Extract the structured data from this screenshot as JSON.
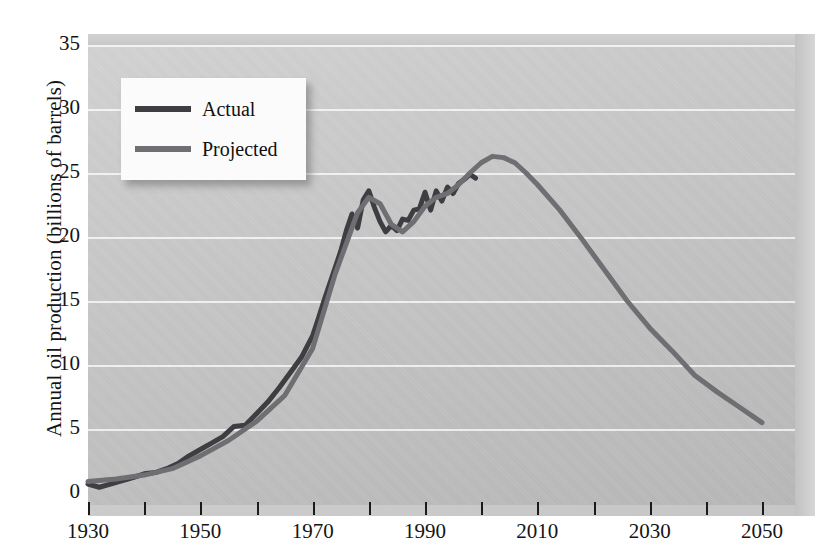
{
  "chart_data": {
    "type": "line",
    "title": "",
    "xlabel": "",
    "ylabel": "Annual oil production (billions of barrels)",
    "xlim": [
      1930,
      2050
    ],
    "ylim": [
      0,
      35
    ],
    "grid": true,
    "legend_position": "upper-left",
    "y_ticks": [
      0,
      5,
      10,
      15,
      20,
      25,
      30,
      35
    ],
    "y_tick_labels": [
      "0",
      "5",
      "10",
      "15",
      "20",
      "25",
      "30",
      "35"
    ],
    "x_ticks": [
      1930,
      1940,
      1950,
      1960,
      1970,
      1980,
      1990,
      2000,
      2010,
      2020,
      2030,
      2040,
      2050
    ],
    "x_tick_labels": [
      "1930",
      "",
      "1950",
      "",
      "1970",
      "",
      "1990",
      "",
      "2010",
      "",
      "2030",
      "",
      "2050"
    ],
    "x_labeled_ticks": [
      "1930",
      "1950",
      "1970",
      "1990",
      "2010",
      "2030",
      "2050"
    ],
    "series": [
      {
        "name": "Actual",
        "color": "#3e3e42",
        "x": [
          1930,
          1932,
          1934,
          1936,
          1938,
          1940,
          1942,
          1944,
          1946,
          1948,
          1950,
          1952,
          1954,
          1956,
          1958,
          1960,
          1962,
          1964,
          1966,
          1968,
          1970,
          1971,
          1972,
          1973,
          1974,
          1975,
          1976,
          1977,
          1978,
          1979,
          1980,
          1981,
          1982,
          1983,
          1984,
          1985,
          1986,
          1987,
          1988,
          1989,
          1990,
          1991,
          1992,
          1993,
          1994,
          1995,
          1996,
          1997,
          1998,
          1999
        ],
        "y": [
          0.7,
          0.45,
          0.7,
          0.95,
          1.2,
          1.5,
          1.6,
          1.9,
          2.3,
          2.9,
          3.4,
          3.9,
          4.4,
          5.2,
          5.3,
          6.2,
          7.1,
          8.2,
          9.4,
          10.6,
          12.3,
          13.6,
          15.0,
          16.3,
          17.6,
          18.9,
          20.5,
          21.8,
          20.7,
          22.9,
          23.6,
          22.3,
          21.2,
          20.4,
          20.9,
          20.5,
          21.4,
          21.3,
          22.1,
          22.2,
          23.5,
          22.1,
          23.6,
          22.8,
          23.9,
          23.4,
          24.2,
          24.5,
          24.9,
          24.6
        ]
      },
      {
        "name": "Projected",
        "color": "#6f6f73",
        "x": [
          1930,
          1935,
          1940,
          1945,
          1950,
          1955,
          1960,
          1965,
          1970,
          1974,
          1978,
          1980,
          1982,
          1984,
          1986,
          1988,
          1990,
          1992,
          1994,
          1996,
          1998,
          2000,
          2002,
          2004,
          2006,
          2008,
          2010,
          2014,
          2018,
          2022,
          2026,
          2030,
          2034,
          2038,
          2042,
          2046,
          2050
        ],
        "y": [
          0.9,
          1.1,
          1.4,
          1.9,
          2.9,
          4.1,
          5.6,
          7.6,
          11.3,
          17.1,
          21.9,
          23.1,
          22.6,
          21.0,
          20.4,
          21.2,
          22.4,
          23.1,
          23.4,
          24.1,
          25.0,
          25.8,
          26.3,
          26.2,
          25.8,
          25.0,
          24.1,
          22.1,
          19.8,
          17.4,
          15.0,
          12.9,
          11.1,
          9.2,
          7.9,
          6.7,
          5.5
        ]
      }
    ]
  },
  "legend": {
    "items": [
      {
        "label": "Actual",
        "color": "#3e3e42"
      },
      {
        "label": "Projected",
        "color": "#6f6f73"
      }
    ]
  }
}
